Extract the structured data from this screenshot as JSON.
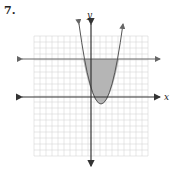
{
  "problem": {
    "number": "7."
  },
  "axes": {
    "x_label": "x",
    "y_label": "y"
  },
  "colors": {
    "grid": "#d4d4d4",
    "axis": "#333333",
    "curve": "#555555",
    "shade": "#b8b8b8",
    "line": "#666666"
  },
  "graph": {
    "description": "Region bounded by upward parabola and horizontal line above x-axis, shaded",
    "parabola": "vertex slightly right of origin, below x-axis",
    "horizontal_line": "y ≈ 4"
  }
}
